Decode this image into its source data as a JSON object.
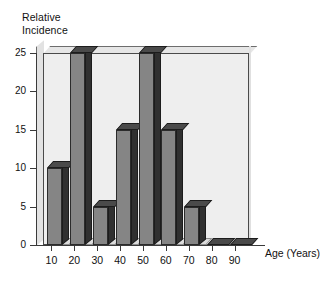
{
  "chart_data": {
    "type": "bar",
    "title": "",
    "subtitle": "",
    "ylabel": "Relative\nIncidence",
    "xlabel": "Age (Years)",
    "categories": [
      "10",
      "20",
      "30",
      "40",
      "50",
      "60",
      "70",
      "80",
      "90"
    ],
    "values": [
      10,
      25,
      5,
      15,
      25,
      15,
      5,
      0,
      0
    ],
    "ylim": [
      0,
      25
    ],
    "yticks": [
      "0",
      "5",
      "10",
      "15",
      "20",
      "25"
    ],
    "ytick_values": [
      0,
      5,
      10,
      15,
      20,
      25
    ],
    "grid": false,
    "legend": null,
    "style": "3d-bar",
    "colors": {
      "bar_front": "#858585",
      "bar_side": "#303030",
      "bar_top": "#4a4a4a",
      "plot_background": "#eeeeee",
      "axis": "#3a3a3a",
      "text": "#111111",
      "page_background": "#ffffff"
    }
  }
}
